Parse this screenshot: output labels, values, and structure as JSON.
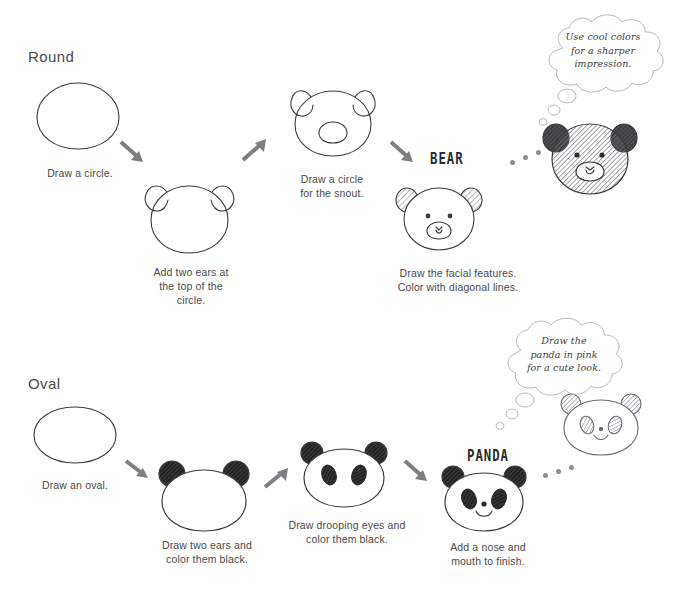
{
  "page": {
    "width": 683,
    "height": 589,
    "background": "#ffffff",
    "ink_color": "#3b3b3b",
    "arrow_color": "#7d7d82",
    "dot_color": "#8e8e92",
    "hatch_color": "#6f7479"
  },
  "sections": [
    {
      "id": "round",
      "title": "Round",
      "result_label": "BEAR",
      "bubble": "Use cool colors\nfor a sharper\nimpression.",
      "bubble_lines": [
        "Use cool colors",
        "for a sharper",
        "impression."
      ],
      "steps": [
        {
          "id": "round-step-1",
          "shape": "circle",
          "caption": "Draw a circle.",
          "caption_lines": [
            "Draw a circle."
          ]
        },
        {
          "id": "round-step-2",
          "shape": "circle-with-ears",
          "caption": "Add two ears at the top of the circle.",
          "caption_lines": [
            "Add two ears at",
            "the top of the",
            "circle."
          ]
        },
        {
          "id": "round-step-3",
          "shape": "bear-with-snout",
          "caption": "Draw a circle for the snout.",
          "caption_lines": [
            "Draw a circle",
            "for the snout."
          ]
        },
        {
          "id": "round-step-4",
          "shape": "bear-face-shaded-ears",
          "caption": "Draw the facial features. Color with diagonal lines.",
          "caption_lines": [
            "Draw the facial features.",
            "Color with diagonal lines."
          ]
        },
        {
          "id": "round-step-5",
          "shape": "bear-fully-hatched",
          "caption": "",
          "caption_lines": []
        }
      ]
    },
    {
      "id": "oval",
      "title": "Oval",
      "result_label": "PANDA",
      "bubble": "Draw the panda in pink for a cute look.",
      "bubble_lines": [
        "Draw the",
        "panda in pink",
        "for a cute look."
      ],
      "steps": [
        {
          "id": "oval-step-1",
          "shape": "oval",
          "caption": "Draw an oval.",
          "caption_lines": [
            "Draw an oval."
          ]
        },
        {
          "id": "oval-step-2",
          "shape": "oval-with-black-ears",
          "caption": "Draw two ears and color them black.",
          "caption_lines": [
            "Draw two ears and",
            "color them black."
          ]
        },
        {
          "id": "oval-step-3",
          "shape": "panda-with-eyes",
          "caption": "Draw drooping eyes and color them black.",
          "caption_lines": [
            "Draw drooping eyes and",
            "color them black."
          ]
        },
        {
          "id": "oval-step-4",
          "shape": "panda-complete",
          "caption": "Add a nose and mouth to finish.",
          "caption_lines": [
            "Add a nose and",
            "mouth to finish."
          ]
        },
        {
          "id": "oval-step-5",
          "shape": "panda-hatched",
          "caption": "",
          "caption_lines": []
        }
      ]
    }
  ],
  "dot_trails": [
    {
      "id": "bear-dot-trail",
      "count": 3
    },
    {
      "id": "panda-dot-trail",
      "count": 3
    }
  ]
}
